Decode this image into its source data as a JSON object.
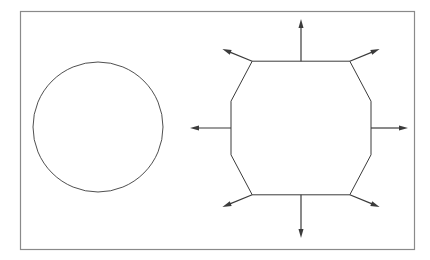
{
  "figure": {
    "canvas": {
      "width": 430,
      "height": 260,
      "background_color": "#ffffff"
    },
    "frame": {
      "name": "outer-border-rectangle",
      "x": 20.5,
      "y": 11.5,
      "width": 394,
      "height": 238,
      "stroke_color": "#8a8a8a",
      "stroke_width": 1.2,
      "fill": "none"
    },
    "shapes": [
      {
        "name": "circle",
        "type": "circle",
        "cx": 98,
        "cy": 127,
        "r": 65,
        "stroke_color": "#3b3b3b",
        "stroke_width": 0.9,
        "fill": "none"
      },
      {
        "name": "octagon",
        "type": "polygon",
        "sides": 8,
        "cx": 301,
        "cy": 128,
        "circumradius": 70,
        "rotation_deg": 22.5,
        "stroke_color": "#3b3b3b",
        "stroke_width": 1.0,
        "fill": "none",
        "vertices": [
          {
            "label": "top-left",
            "x": 252.2,
            "y": 61.2
          },
          {
            "label": "top-right",
            "x": 349.8,
            "y": 61.2
          },
          {
            "label": "right-top",
            "x": 371.0,
            "y": 101.2
          },
          {
            "label": "right-bottom",
            "x": 371.0,
            "y": 154.8
          },
          {
            "label": "bottom-right",
            "x": 349.8,
            "y": 194.8
          },
          {
            "label": "bottom-left",
            "x": 252.2,
            "y": 194.8
          },
          {
            "label": "left-bottom",
            "x": 231.0,
            "y": 154.8
          },
          {
            "label": "left-top",
            "x": 231.0,
            "y": 101.2
          }
        ]
      }
    ],
    "arrows": {
      "name": "outward-normal-arrows",
      "count": 8,
      "stroke_color": "#3b3b3b",
      "stroke_width": 1.2,
      "head_length": 9,
      "head_width": 5,
      "items": [
        {
          "label": "arrow-north",
          "direction": "N",
          "x1": 301.0,
          "y1": 61.2,
          "x2": 301.0,
          "y2": 19.0
        },
        {
          "label": "arrow-northeast",
          "direction": "NE",
          "x1": 349.8,
          "y1": 61.2,
          "x2": 379.6,
          "y2": 49.0
        },
        {
          "label": "arrow-east",
          "direction": "E",
          "x1": 371.0,
          "y1": 128.0,
          "x2": 408.0,
          "y2": 128.0
        },
        {
          "label": "arrow-southeast",
          "direction": "SE",
          "x1": 349.8,
          "y1": 194.8,
          "x2": 379.6,
          "y2": 207.0
        },
        {
          "label": "arrow-south",
          "direction": "S",
          "x1": 301.0,
          "y1": 194.8,
          "x2": 301.0,
          "y2": 238.0
        },
        {
          "label": "arrow-southwest",
          "direction": "SW",
          "x1": 252.2,
          "y1": 194.8,
          "x2": 222.4,
          "y2": 207.0
        },
        {
          "label": "arrow-west",
          "direction": "W",
          "x1": 231.0,
          "y1": 128.0,
          "x2": 190.0,
          "y2": 128.0
        },
        {
          "label": "arrow-northwest",
          "direction": "NW",
          "x1": 252.2,
          "y1": 61.2,
          "x2": 222.4,
          "y2": 49.0
        }
      ]
    }
  }
}
